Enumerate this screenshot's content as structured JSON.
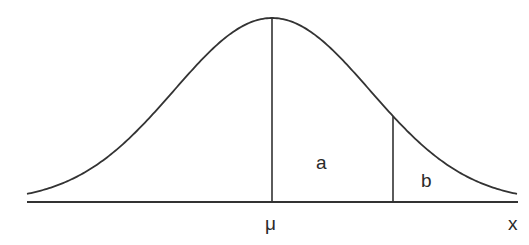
{
  "diagram": {
    "type": "normal-distribution-curve",
    "labels": {
      "mean": "μ",
      "axis": "x",
      "region_a": "a",
      "region_b": "b"
    },
    "colors": {
      "stroke": "#333333",
      "text": "#2a2a2a",
      "background": "#ffffff"
    }
  }
}
